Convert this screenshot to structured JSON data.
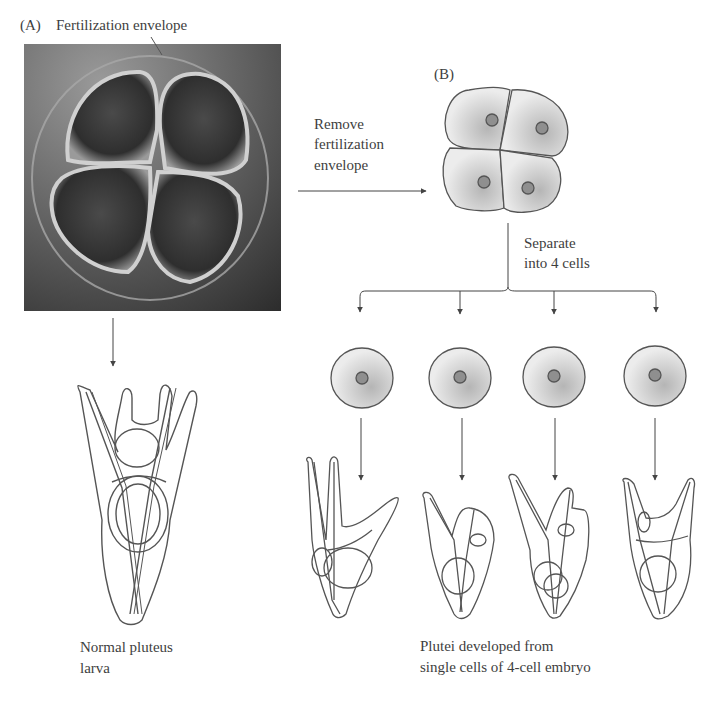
{
  "panel_a": {
    "tag": "(A)",
    "caption": "Fertilization envelope",
    "photo_description": "4-cell sea urchin embryo within fertilization envelope (micrograph)",
    "larva_label_line1": "Normal pluteus",
    "larva_label_line2": "larva"
  },
  "panel_b": {
    "tag": "(B)",
    "step1_line1": "Remove",
    "step1_line2": "fertilization",
    "step1_line3": "envelope",
    "step2_line1": "Separate",
    "step2_line2": "into 4 cells",
    "result_line1": "Plutei developed from",
    "result_line2": "single cells of 4-cell embryo",
    "separated_cells_count": 4
  },
  "colors": {
    "line": "#4a4a4a",
    "cell_fill": "#e4e4e4",
    "cell_shade": "#b9b9b9",
    "nucleus": "#8f8f8f",
    "photo_bg": "#5a5a5a"
  }
}
